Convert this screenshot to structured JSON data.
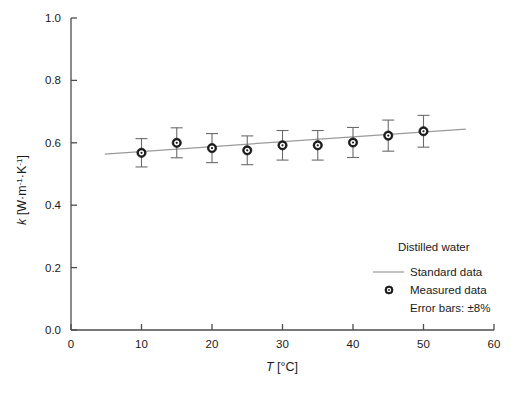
{
  "chart_data": {
    "type": "scatter",
    "title": "",
    "xlabel": "T [°C]",
    "ylabel": "k [W·m⁻¹·K⁻¹]",
    "xlim": [
      0,
      60
    ],
    "ylim": [
      0.0,
      1.0
    ],
    "xticks": [
      0,
      10,
      20,
      30,
      40,
      50,
      60
    ],
    "xtick_labels": [
      "0",
      "10",
      "20",
      "30",
      "40",
      "50",
      "60"
    ],
    "yticks": [
      0.0,
      0.2,
      0.4,
      0.6,
      0.8,
      1.0
    ],
    "ytick_labels": [
      "0.0",
      "0.2",
      "0.4",
      "0.6",
      "0.8",
      "1.0"
    ],
    "grid": false,
    "legend_position": "inside-lower-right",
    "series": [
      {
        "name": "Standard data",
        "type": "line",
        "color": "#9a9a9a",
        "x": [
          4.8,
          56.0
        ],
        "values": [
          0.564,
          0.644
        ]
      },
      {
        "name": "Measured data",
        "type": "scatter",
        "color": "#1a1a1a",
        "marker": "circle-dot",
        "x": [
          10,
          15,
          20,
          25,
          30,
          35,
          40,
          45,
          50
        ],
        "values": [
          0.568,
          0.6,
          0.583,
          0.576,
          0.592,
          0.592,
          0.601,
          0.623,
          0.637
        ],
        "error_percent": 8,
        "error_bars": [
          0.0454,
          0.048,
          0.0466,
          0.0461,
          0.0474,
          0.0474,
          0.0481,
          0.0498,
          0.051
        ]
      }
    ]
  },
  "legend": {
    "heading": "Distilled water",
    "entries": [
      {
        "label": "Standard data",
        "marker": "line"
      },
      {
        "label": "Measured data",
        "marker": "circle-dot"
      }
    ],
    "note": "Error bars: ±8%"
  },
  "axis": {
    "x": {
      "label_symbol": "T",
      "label_unit": "[°C]"
    },
    "y": {
      "label_symbol": "k",
      "label_unit_open": "[W·m",
      "label_unit_sup1": "-1",
      "label_unit_mid": "·K",
      "label_unit_sup2": "-1",
      "label_unit_close": "]"
    }
  },
  "colors": {
    "axis": "#4d4d4d",
    "standard_line": "#9a9a9a",
    "marker": "#1a1a1a",
    "error_bar": "#6b6b6b",
    "text": "#1a1a1a",
    "background": "#ffffff"
  }
}
